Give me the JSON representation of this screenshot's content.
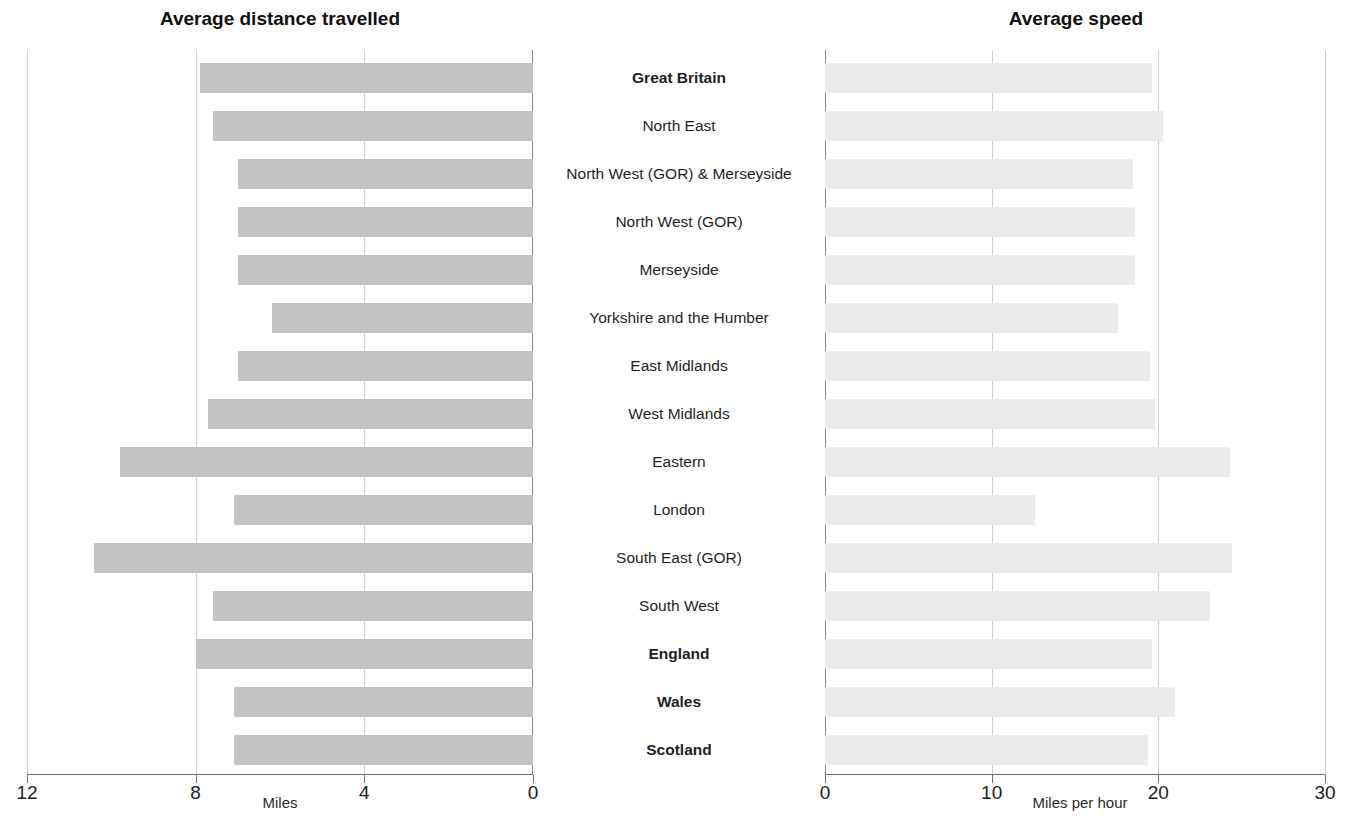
{
  "panels": {
    "left": {
      "title": "Average distance travelled",
      "axis_title": "Miles"
    },
    "right": {
      "title": "Average speed",
      "axis_title": "Miles per hour"
    }
  },
  "left_ticks": [
    "12",
    "8",
    "4",
    "0"
  ],
  "right_ticks": [
    "0",
    "10",
    "20",
    "30"
  ],
  "categories": [
    "Great Britain",
    "North East",
    "North West (GOR) & Merseyside",
    "North West (GOR)",
    "Merseyside",
    "Yorkshire and the Humber",
    "East Midlands",
    "West Midlands",
    "Eastern",
    "London",
    "South East (GOR)",
    "South West",
    "England",
    "Wales",
    "Scotland"
  ],
  "bold_categories": [
    "Great Britain",
    "England",
    "Wales",
    "Scotland"
  ],
  "colors": {
    "bar_distance": "#c3c3c3",
    "bar_speed": "#ebebeb",
    "gridline": "#cfcfcf",
    "axis": "#6e6e6e",
    "text": "#1a1a1a"
  },
  "chart_data": [
    {
      "type": "bar",
      "orientation": "horizontal",
      "title": "Average distance travelled",
      "xlabel": "Miles",
      "ylabel": "",
      "xlim": [
        12,
        0
      ],
      "reversed_axis": true,
      "xticks": [
        12,
        8,
        4,
        0
      ],
      "grid": true,
      "legend": "none",
      "categories": [
        "Great Britain",
        "North East",
        "North West (GOR) & Merseyside",
        "North West (GOR)",
        "Merseyside",
        "Yorkshire and the Humber",
        "East Midlands",
        "West Midlands",
        "Eastern",
        "London",
        "South East (GOR)",
        "South West",
        "England",
        "Wales",
        "Scotland"
      ],
      "values": [
        7.9,
        7.6,
        7.0,
        7.0,
        7.0,
        6.2,
        7.0,
        7.7,
        9.8,
        7.1,
        10.4,
        7.6,
        8.0,
        7.1,
        7.1
      ]
    },
    {
      "type": "bar",
      "orientation": "horizontal",
      "title": "Average speed",
      "xlabel": "Miles per hour",
      "ylabel": "",
      "xlim": [
        0,
        30
      ],
      "reversed_axis": false,
      "xticks": [
        0,
        10,
        20,
        30
      ],
      "grid": true,
      "legend": "none",
      "categories": [
        "Great Britain",
        "North East",
        "North West (GOR) & Merseyside",
        "North West (GOR)",
        "Merseyside",
        "Yorkshire and the Humber",
        "East Midlands",
        "West Midlands",
        "Eastern",
        "London",
        "South East (GOR)",
        "South West",
        "England",
        "Wales",
        "Scotland"
      ],
      "values": [
        19.6,
        20.3,
        18.5,
        18.6,
        18.6,
        17.6,
        19.5,
        19.8,
        24.3,
        12.6,
        24.4,
        23.1,
        19.6,
        21.0,
        19.4
      ]
    }
  ]
}
